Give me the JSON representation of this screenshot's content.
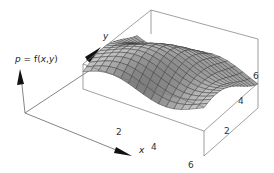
{
  "chart_data": {
    "type": "surface3d",
    "title": "",
    "zlabel": "p = f(x,y)",
    "xlabel": "x",
    "ylabel": "y",
    "x_ticks": [
      "2",
      "4",
      "6"
    ],
    "y_ticks": [
      "2",
      "4",
      "6"
    ],
    "x_range": [
      0,
      6.5
    ],
    "y_range": [
      0,
      6.5
    ],
    "grid": false,
    "box": true,
    "mesh_lines": 16,
    "surface": "smooth wave surface with a ridge running diagonally and a trough near the front-right corner",
    "colors": {
      "surface_light": "#d8d8d8",
      "surface_dark": "#707070",
      "mesh": "#333333",
      "box": "#777777",
      "axis": "#555555"
    }
  },
  "labels": {
    "p_axis": "p = f(x,y)",
    "x_axis": "x",
    "y_axis": "y"
  },
  "ticks": {
    "x": [
      {
        "text": "2",
        "x": 116,
        "y": 135
      },
      {
        "text": "4",
        "x": 151,
        "y": 150
      },
      {
        "text": "6",
        "x": 188,
        "y": 168
      }
    ],
    "y": [
      {
        "text": "2",
        "x": 224,
        "y": 134
      },
      {
        "text": "4",
        "x": 238,
        "y": 104
      },
      {
        "text": "6",
        "x": 253,
        "y": 79
      }
    ]
  }
}
